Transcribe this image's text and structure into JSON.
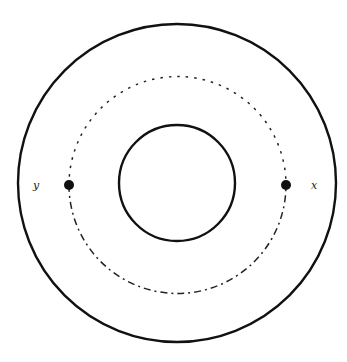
{
  "diagram": {
    "type": "concentric-circles",
    "center": {
      "x": 177,
      "y": 184
    },
    "outer_circle": {
      "r": 159,
      "style": "solid"
    },
    "inner_circle": {
      "r": 58,
      "style": "solid"
    },
    "middle_path": {
      "r": 108,
      "upper_style": "dotted",
      "lower_style": "dash-dot"
    },
    "points": [
      {
        "id": "y",
        "label": "y",
        "x": 69,
        "y": 185,
        "label_x": 33,
        "label_y": 189
      },
      {
        "id": "x",
        "label": "x",
        "x": 286,
        "y": 185,
        "label_x": 313,
        "label_y": 189
      }
    ],
    "colors": {
      "stroke": "#111111",
      "background": "#ffffff"
    }
  }
}
